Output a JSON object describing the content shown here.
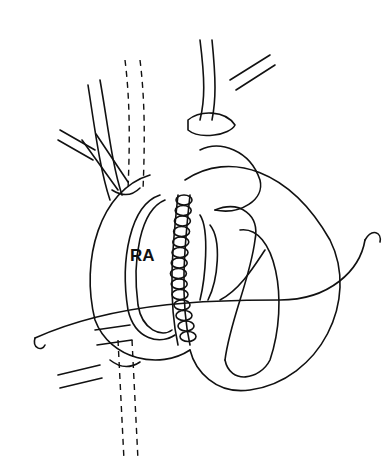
{
  "figure": {
    "label_ra": "RA",
    "colors": {
      "line": "#111111",
      "background": "#ffffff"
    }
  }
}
